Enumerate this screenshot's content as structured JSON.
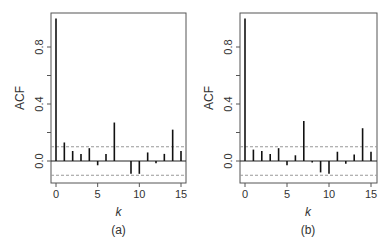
{
  "figure": {
    "panels": [
      {
        "label": "(a)",
        "xlabel": "k",
        "ylabel": "ACF"
      },
      {
        "label": "(b)",
        "xlabel": "k",
        "ylabel": "ACF"
      }
    ],
    "yticks": [
      "0.0",
      "0.4",
      "0.8"
    ],
    "xticks": [
      "0",
      "5",
      "10",
      "15"
    ]
  },
  "chart_data": [
    {
      "type": "bar",
      "title": "(a)",
      "xlabel": "k",
      "ylabel": "ACF",
      "x": [
        0,
        1,
        2,
        3,
        4,
        5,
        6,
        7,
        8,
        9,
        10,
        11,
        12,
        13,
        14,
        15
      ],
      "values": [
        1.0,
        0.13,
        0.07,
        0.05,
        0.09,
        -0.03,
        0.05,
        0.27,
        0.0,
        -0.09,
        -0.09,
        0.06,
        -0.015,
        0.05,
        0.22,
        0.07
      ],
      "confidence_bounds": [
        -0.1,
        0.1
      ],
      "xlim": [
        0,
        15
      ],
      "ylim": [
        -0.15,
        1.0
      ],
      "yticks": [
        0.0,
        0.2,
        0.4,
        0.6,
        0.8
      ],
      "ytick_labels": [
        "0.0",
        "",
        "0.4",
        "",
        "0.8"
      ],
      "xticks": [
        0,
        5,
        10,
        15
      ],
      "grid": false,
      "style": "ACF lollipop/spike plot with dashed significance bounds"
    },
    {
      "type": "bar",
      "title": "(b)",
      "xlabel": "k",
      "ylabel": "ACF",
      "x": [
        0,
        1,
        2,
        3,
        4,
        5,
        6,
        7,
        8,
        9,
        10,
        11,
        12,
        13,
        14,
        15
      ],
      "values": [
        1.0,
        0.08,
        0.07,
        0.05,
        0.09,
        -0.03,
        0.04,
        0.28,
        -0.01,
        -0.08,
        -0.09,
        0.065,
        -0.02,
        0.045,
        0.23,
        0.065
      ],
      "confidence_bounds": [
        -0.1,
        0.1
      ],
      "xlim": [
        0,
        15
      ],
      "ylim": [
        -0.15,
        1.0
      ],
      "yticks": [
        0.0,
        0.2,
        0.4,
        0.6,
        0.8
      ],
      "ytick_labels": [
        "0.0",
        "",
        "0.4",
        "",
        "0.8"
      ],
      "xticks": [
        0,
        5,
        10,
        15
      ],
      "grid": false,
      "style": "ACF lollipop/spike plot with dashed significance bounds"
    }
  ]
}
